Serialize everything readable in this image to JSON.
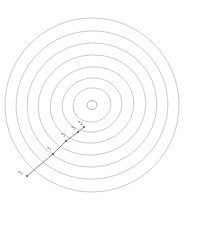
{
  "figure": {
    "background_color": "#ffffff",
    "contour_color": "#b9b9bd",
    "path_color": "#6e6e74",
    "label_color": "#4a4a50",
    "width": 201,
    "height": 230
  },
  "chart_data": {
    "type": "line",
    "xlabel": "",
    "ylabel": "",
    "grid": false,
    "legend": false,
    "xlim": [
      0,
      201
    ],
    "ylim": [
      230,
      0
    ],
    "center": {
      "x": 92,
      "y": 105
    },
    "contours": {
      "count": 8,
      "description": "Nested closed level-set curves around a single minimum",
      "levels": [
        {
          "index": 0,
          "rx": 5,
          "ry": 4.5,
          "rotation": -12
        },
        {
          "index": 1,
          "rx": 19,
          "ry": 17,
          "rotation": -12
        },
        {
          "index": 2,
          "rx": 30,
          "ry": 27,
          "rotation": -12
        },
        {
          "index": 3,
          "rx": 42,
          "ry": 38,
          "rotation": -12
        },
        {
          "index": 4,
          "rx": 54,
          "ry": 50,
          "rotation": -12
        },
        {
          "index": 5,
          "rx": 65,
          "ry": 62,
          "rotation": -12
        },
        {
          "index": 6,
          "rx": 76,
          "ry": 74,
          "rotation": -12
        },
        {
          "index": 7,
          "rx": 87,
          "ry": 87,
          "rotation": -12
        }
      ]
    },
    "series": [
      {
        "name": "descent-path",
        "points": [
          {
            "label": "x0",
            "x": 27,
            "y": 176
          },
          {
            "label": "x1",
            "x": 53,
            "y": 154
          },
          {
            "label": "x2",
            "x": 66,
            "y": 141
          },
          {
            "label": "x3",
            "x": 78,
            "y": 132
          },
          {
            "label": "x4",
            "x": 84,
            "y": 127
          }
        ]
      }
    ],
    "annotations": [
      {
        "name": "x0",
        "base": "x",
        "sub": "0",
        "x": 18,
        "y": 169
      },
      {
        "name": "x1",
        "base": "x",
        "sub": "1",
        "x": 47,
        "y": 145
      },
      {
        "name": "x2",
        "base": "x",
        "sub": "2",
        "x": 61,
        "y": 131
      },
      {
        "name": "x3",
        "base": "x",
        "sub": "3",
        "x": 71,
        "y": 124
      },
      {
        "name": "x4",
        "base": "x",
        "sub": "4",
        "x": 78,
        "y": 119
      }
    ]
  },
  "labels": {
    "x0": {
      "base": "x",
      "sub": "0"
    },
    "x1": {
      "base": "x",
      "sub": "1"
    },
    "x2": {
      "base": "x",
      "sub": "2"
    },
    "x3": {
      "base": "x",
      "sub": "3"
    },
    "x4": {
      "base": "x",
      "sub": "4"
    }
  }
}
